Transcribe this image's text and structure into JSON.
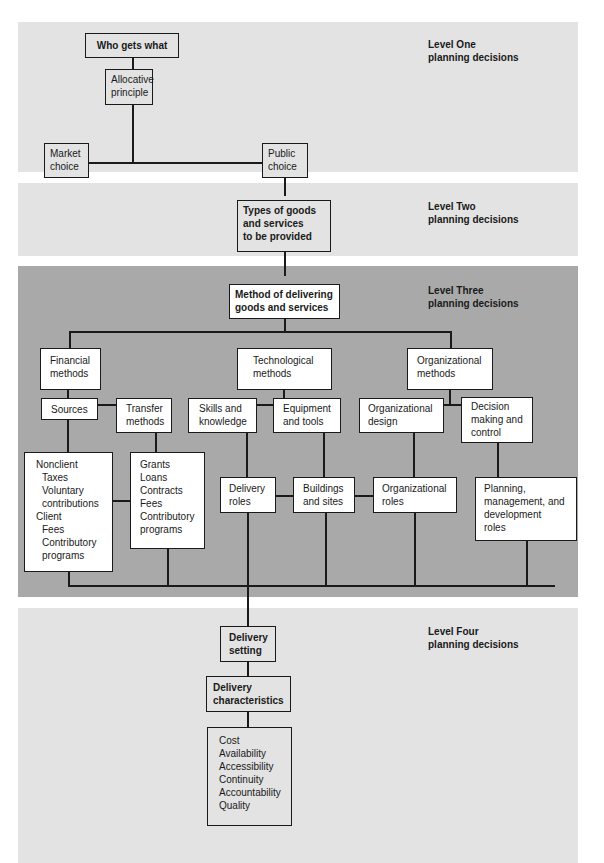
{
  "levels": [
    {
      "title": "Level One",
      "subtitle": "planning decisions"
    },
    {
      "title": "Level Two",
      "subtitle": "planning decisions"
    },
    {
      "title": "Level Three",
      "subtitle": "planning decisions"
    },
    {
      "title": "Level Four",
      "subtitle": "planning decisions"
    }
  ],
  "level1": {
    "who_gets_what": "Who gets what",
    "allocative": [
      "Allocative",
      "principle"
    ],
    "market": [
      "Market",
      "choice"
    ],
    "public": [
      "Public",
      "choice"
    ]
  },
  "level2": {
    "types": [
      "Types of goods",
      "and services",
      "to be provided"
    ]
  },
  "level3": {
    "method": [
      "Method of delivering",
      "goods and services"
    ],
    "financial": [
      "Financial",
      "methods"
    ],
    "technological": [
      "Technological",
      "methods"
    ],
    "organizational": [
      "Organizational",
      "methods"
    ],
    "sources": "Sources",
    "transfer": [
      "Transfer",
      "methods"
    ],
    "skills": [
      "Skills and",
      "knowledge"
    ],
    "equipment": [
      "Equipment",
      "and tools"
    ],
    "org_design": [
      "Organizational",
      "design"
    ],
    "decision": [
      "Decision",
      "making and",
      "control"
    ],
    "sources_list": {
      "nonclient": "Nonclient",
      "nonclient_items": [
        "Taxes",
        "Voluntary",
        "contributions"
      ],
      "client": "Client",
      "client_items": [
        "Fees",
        "Contributory",
        "programs"
      ]
    },
    "transfer_list": [
      "Grants",
      "Loans",
      "Contracts",
      "Fees",
      "Contributory",
      "programs"
    ],
    "delivery_roles": [
      "Delivery",
      "roles"
    ],
    "buildings": [
      "Buildings",
      "and sites"
    ],
    "org_roles": [
      "Organizational",
      "roles"
    ],
    "planning_roles": [
      "Planning,",
      "management, and",
      "development",
      "roles"
    ]
  },
  "level4": {
    "setting": [
      "Delivery",
      "setting"
    ],
    "characteristics": [
      "Delivery",
      "characteristics"
    ],
    "characteristics_list": [
      "Cost",
      "Availability",
      "Accessibility",
      "Continuity",
      "Accountability",
      "Quality"
    ]
  },
  "colors": {
    "light_panel": "#e3e3e3",
    "dark_panel": "#a9a9a9",
    "border": "#1a1a1a"
  }
}
